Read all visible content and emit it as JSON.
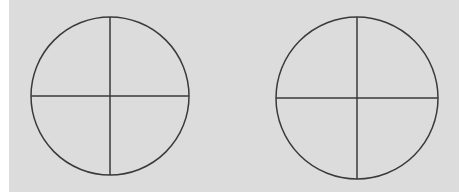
{
  "figure": {
    "background_color": "#dcdcdc",
    "line_color": "#3a3a3a",
    "line_width": 1.5,
    "shapes": [
      {
        "type": "circle-with-crosshair",
        "cx": 110,
        "cy": 96,
        "r": 79,
        "vertical_line_x": 110,
        "horizontal_line_y": 96
      },
      {
        "type": "circle-with-crosshair",
        "cx": 357,
        "cy": 98,
        "r": 81,
        "vertical_line_x": 357,
        "horizontal_line_y": 98
      }
    ]
  }
}
